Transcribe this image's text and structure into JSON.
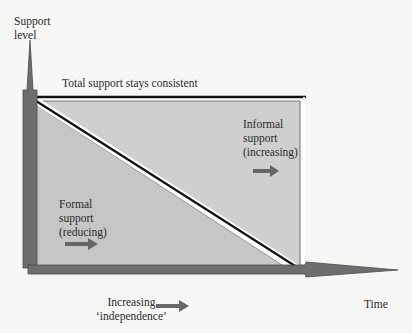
{
  "axes": {
    "y_label_line1": "Support",
    "y_label_line2": "level",
    "x_label": "Time"
  },
  "annotations": {
    "total_support": "Total support stays consistent",
    "informal": {
      "line1": "Informal",
      "line2": "support",
      "line3": "(increasing)"
    },
    "formal": {
      "line1": "Formal",
      "line2": "support",
      "line3": "(reducing)"
    },
    "independence": {
      "line1": "Increasing",
      "line2": "‘independence’"
    }
  },
  "colors": {
    "background": "#f7f7f6",
    "region_fill": "#cdcdcd",
    "axis_arrow": "#6b6b6b",
    "line": "#111111"
  }
}
